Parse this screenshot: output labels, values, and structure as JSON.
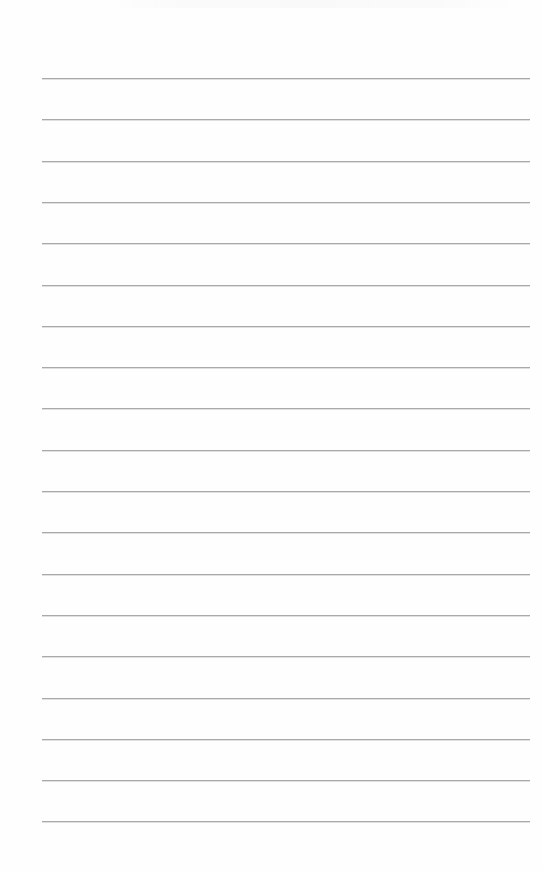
{
  "document": {
    "type": "ruled-sheet",
    "background_color": "#fefefe",
    "line_color": "#a9a9a9",
    "line_count": 19,
    "line_left_px": 42,
    "line_right_px": 530,
    "first_line_top_px": 78,
    "line_spacing_px": 41.3,
    "text_lines": [
      "",
      "",
      "",
      "",
      "",
      "",
      "",
      "",
      "",
      "",
      "",
      "",
      "",
      "",
      "",
      "",
      "",
      "",
      ""
    ]
  }
}
